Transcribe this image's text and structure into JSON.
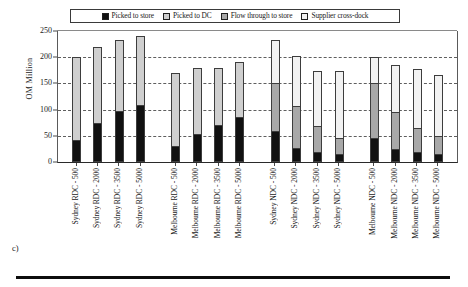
{
  "panel_letter": "c)",
  "legend": {
    "position": "top-center",
    "entries": [
      {
        "label": "Picked to store",
        "swatch": "fill-picked-store",
        "icon": "legend-swatch-icon"
      },
      {
        "label": "Picked to DC",
        "swatch": "fill-picked-dc",
        "icon": "legend-swatch-icon"
      },
      {
        "label": "Flow through to store",
        "swatch": "fill-flow-store",
        "icon": "legend-swatch-icon"
      },
      {
        "label": "Supplier cross-dock",
        "swatch": "fill-supplier-cross",
        "icon": "legend-swatch-icon"
      }
    ]
  },
  "chart_data": {
    "type": "bar",
    "subtype": "stacked",
    "title": "",
    "xlabel": "",
    "ylabel": "OM Million",
    "ylim": [
      0,
      250
    ],
    "yticks": [
      0,
      50,
      100,
      150,
      200,
      250
    ],
    "grid": true,
    "categories": [
      "Sydney RDC - 500",
      "Sydney RDC - 2000",
      "Sydney RDC - 3500",
      "Sydney RDC - 5000",
      "Melbourne RDC - 500",
      "Melbourne RDC - 2000",
      "Melbourne RDC - 3500",
      "Melbourne RDC - 5000",
      "Sydney NDC - 500",
      "Sydney NDC - 2000",
      "Sydney NDC - 3500",
      "Sydney NDC - 5000",
      "Melbourne NDC - 500",
      "Melbourne NDC - 2000",
      "Melbourne NDC - 3500",
      "Melbourne NDC - 5000"
    ],
    "group_breaks": [
      4,
      8,
      12
    ],
    "series": [
      {
        "name": "Picked to store",
        "values": [
          38,
          72,
          95,
          107,
          28,
          50,
          69,
          83,
          57,
          23,
          16,
          12,
          42,
          21,
          16,
          12
        ]
      },
      {
        "name": "Picked to DC",
        "values": [
          162,
          148,
          138,
          133,
          141,
          129,
          111,
          107,
          0,
          0,
          0,
          0,
          0,
          0,
          0,
          0
        ]
      },
      {
        "name": "Flow through to store",
        "values": [
          0,
          0,
          0,
          0,
          0,
          0,
          0,
          0,
          92,
          82,
          51,
          30,
          108,
          72,
          46,
          34
        ]
      },
      {
        "name": "Supplier cross-dock",
        "values": [
          0,
          0,
          0,
          0,
          0,
          0,
          0,
          0,
          84,
          97,
          106,
          132,
          51,
          93,
          115,
          120
        ]
      }
    ],
    "totals": [
      200,
      220,
      233,
      240,
      169,
      179,
      180,
      190,
      233,
      202,
      173,
      174,
      201,
      186,
      177,
      166
    ]
  }
}
